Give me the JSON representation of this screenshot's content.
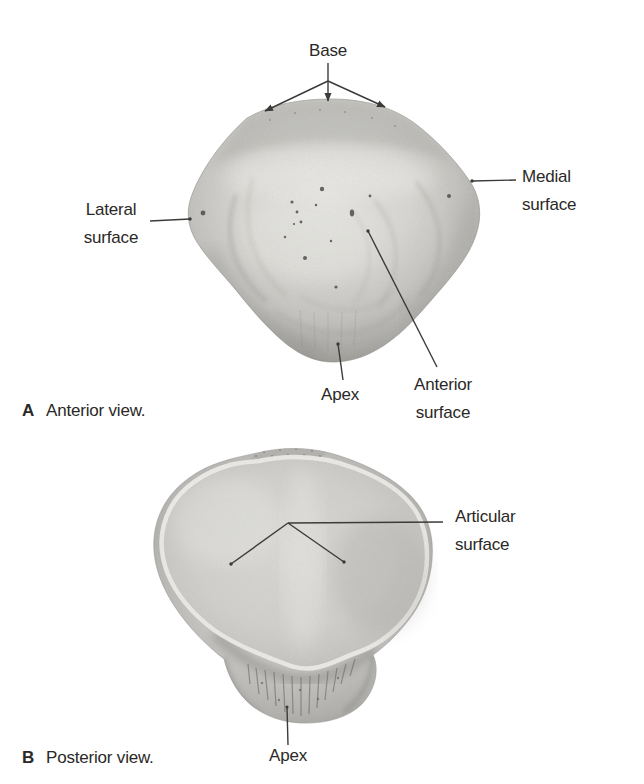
{
  "figure": {
    "background_color": "#ffffff",
    "text_color": "#2a2927",
    "leader_line_color": "#3c3b39"
  },
  "panel_a": {
    "caption_letter": "A",
    "caption": "Anterior view.",
    "labels": {
      "base": "Base",
      "lateral_surface": "Lateral\nsurface",
      "medial_surface": "Medial\nsurface",
      "apex": "Apex",
      "anterior_surface": "Anterior\nsurface"
    }
  },
  "panel_b": {
    "caption_letter": "B",
    "caption": "Posterior view.",
    "labels": {
      "articular_surface": "Articular\nsurface",
      "apex": "Apex"
    }
  }
}
